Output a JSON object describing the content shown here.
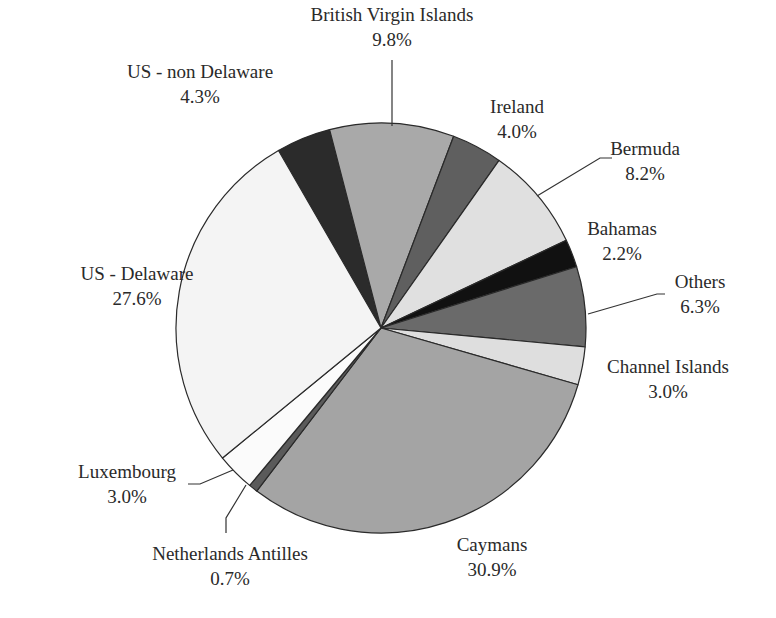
{
  "chart_data": {
    "type": "pie",
    "title": "",
    "start_angle_deg": -30,
    "direction": "clockwise",
    "slices": [
      {
        "label": "US - non Delaware",
        "value": 4.3,
        "display": "4.3%",
        "color": "#2b2b2b"
      },
      {
        "label": "British Virgin Islands",
        "value": 9.8,
        "display": "9.8%",
        "color": "#a9a9a9"
      },
      {
        "label": "Ireland",
        "value": 4.0,
        "display": "4.0%",
        "color": "#5f5f5f"
      },
      {
        "label": "Bermuda",
        "value": 8.2,
        "display": "8.2%",
        "color": "#e0e0e0"
      },
      {
        "label": "Bahamas",
        "value": 2.2,
        "display": "2.2%",
        "color": "#111111"
      },
      {
        "label": "Others",
        "value": 6.3,
        "display": "6.3%",
        "color": "#6a6a6a"
      },
      {
        "label": "Channel Islands",
        "value": 3.0,
        "display": "3.0%",
        "color": "#dedede"
      },
      {
        "label": "Caymans",
        "value": 30.9,
        "display": "30.9%",
        "color": "#a4a4a4"
      },
      {
        "label": "Netherlands Antilles",
        "value": 0.7,
        "display": "0.7%",
        "color": "#5a5a5a"
      },
      {
        "label": "Luxembourg",
        "value": 3.0,
        "display": "3.0%",
        "color": "#fbfbfb"
      },
      {
        "label": "US - Delaware",
        "value": 27.6,
        "display": "27.6%",
        "color": "#f4f4f4"
      }
    ],
    "legend": "none (labels beside slices)"
  },
  "labels": [
    {
      "name": "US - non Delaware",
      "pct": "4.3%"
    },
    {
      "name": "British Virgin Islands",
      "pct": "9.8%"
    },
    {
      "name": "Ireland",
      "pct": "4.0%"
    },
    {
      "name": "Bermuda",
      "pct": "8.2%"
    },
    {
      "name": "Bahamas",
      "pct": "2.2%"
    },
    {
      "name": "Others",
      "pct": "6.3%"
    },
    {
      "name": "Channel Islands",
      "pct": "3.0%"
    },
    {
      "name": "Caymans",
      "pct": "30.9%"
    },
    {
      "name": "Netherlands Antilles",
      "pct": "0.7%"
    },
    {
      "name": "Luxembourg",
      "pct": "3.0%"
    },
    {
      "name": "US - Delaware",
      "pct": "27.6%"
    }
  ]
}
